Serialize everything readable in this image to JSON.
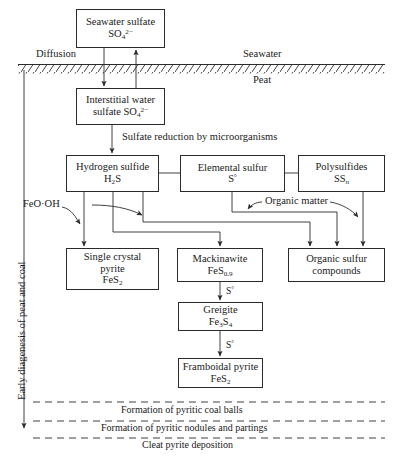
{
  "figure": {
    "side_label": "Early diagenesis of peat and coal"
  },
  "zones": {
    "seawater": "Seawater",
    "peat": "Peat",
    "diffusion": "Diffusion"
  },
  "boxes": {
    "seawater_sulfate": {
      "line1": "Seawater sulfate",
      "line2": "SO",
      "sub2": "4",
      "sup2": "2−"
    },
    "interstitial_sulfate": {
      "line1": "Interstitial water",
      "line2": "sulfate SO",
      "sub2": "4",
      "sup2": "2−"
    },
    "hydrogen_sulfide": {
      "line1": "Hydrogen sulfide",
      "line2": "H",
      "sub2": "2",
      "line2b": "S"
    },
    "elemental_sulfur": {
      "line1": "Elemental sulfur",
      "line2": "S",
      "sup2": "°"
    },
    "polysulfides": {
      "line1": "Polysulfides",
      "line2": "SS",
      "sub2": "n"
    },
    "single_crystal_pyrite": {
      "line1": "Single crystal",
      "line2": "pyrite",
      "line3": "FeS",
      "sub3": "2"
    },
    "mackinawite": {
      "line1": "Mackinawite",
      "line2": "FeS",
      "sub2": "0.9"
    },
    "organic_sulfur": {
      "line1": "Organic sulfur",
      "line2": "compounds"
    },
    "greigite": {
      "line1": "Greigite",
      "line2": "Fe",
      "sub2": "3",
      "line2b": "S",
      "sub2b": "4"
    },
    "framboidal_pyrite": {
      "line1": "Framboidal pyrite",
      "line2": "FeS",
      "sub2": "2"
    }
  },
  "process_labels": {
    "sulfate_reduction": "Sulfate reduction by microorganisms",
    "organic_matter": "Organic matter",
    "iron_oxyhydroxide": "FeO·OH",
    "sulfur_step_1": "S°",
    "sulfur_step_2": "S°"
  },
  "horizons": {
    "coal_balls": "Formation of pyritic coal balls",
    "nodules": "Formation of pyritic nodules and partings",
    "cleat": "Cleat pyrite deposition"
  },
  "colors": {
    "stroke": "#2b2b2b",
    "text": "#1a1a1a",
    "background": "#ffffff"
  }
}
